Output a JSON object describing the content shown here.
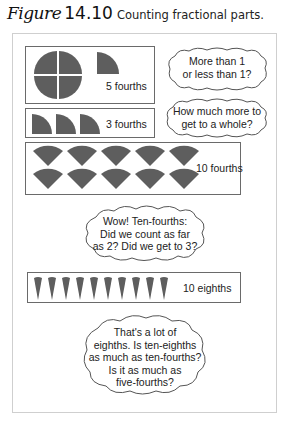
{
  "figure": {
    "label": "Figure",
    "number": "14.10",
    "caption": "Counting fractional parts."
  },
  "colors": {
    "shape_fill": "#5e5e5e",
    "box_border": "#6a6a6a",
    "frame_border": "#cfcfcf"
  },
  "panels": [
    {
      "id": "five-fourths",
      "label": "5 fourths",
      "shape": "quarter-circle",
      "count": 5,
      "arrangement": "1 whole circle (4 quarters) + 1 quarter"
    },
    {
      "id": "three-fourths",
      "label": "3 fourths",
      "shape": "quarter-circle",
      "count": 3
    },
    {
      "id": "ten-fourths",
      "label": "10 fourths",
      "shape": "quarter-wedge",
      "count": 10,
      "rows": 2
    },
    {
      "id": "ten-eighths",
      "label": "10 eighths",
      "shape": "eighth-wedge",
      "count": 10
    }
  ],
  "bubbles": [
    {
      "id": "more-or-less",
      "lines": [
        "More than 1",
        "or less than 1?"
      ]
    },
    {
      "id": "how-much-more",
      "lines": [
        "How much more to",
        "get to a whole?"
      ]
    },
    {
      "id": "ten-fourths-question",
      "lines": [
        "Wow! Ten-fourths:",
        "Did we count as far",
        "as 2? Did we get to 3?"
      ]
    },
    {
      "id": "eighths-question",
      "lines": [
        "That's a lot of",
        "eighths. Is ten-eighths",
        "as much as ten-fourths?",
        "Is it as much as",
        "five-fourths?"
      ]
    }
  ]
}
